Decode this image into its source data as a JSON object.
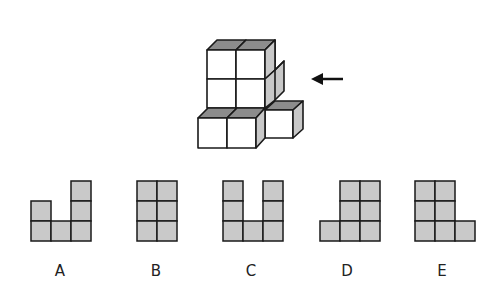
{
  "colors": {
    "line": "#1a1a1a",
    "cube_front": "#ffffff",
    "cube_top": "#8c8c8c",
    "cube_side": "#c8c8c8",
    "cell_fill": "#c9c9c9",
    "background": "#ffffff"
  },
  "figure": {
    "arrow_icon": "arrow-left"
  },
  "options": [
    {
      "label": "A",
      "cells": [
        [
          0,
          1
        ],
        [
          0,
          2
        ],
        [
          1,
          2
        ],
        [
          2,
          0
        ],
        [
          2,
          1
        ],
        [
          2,
          2
        ]
      ]
    },
    {
      "label": "B",
      "cells": [
        [
          0,
          0
        ],
        [
          1,
          0
        ],
        [
          0,
          1
        ],
        [
          1,
          1
        ],
        [
          0,
          2
        ],
        [
          1,
          2
        ]
      ]
    },
    {
      "label": "C",
      "cells": [
        [
          0,
          0
        ],
        [
          0,
          1
        ],
        [
          0,
          2
        ],
        [
          1,
          2
        ],
        [
          2,
          0
        ],
        [
          2,
          1
        ],
        [
          2,
          2
        ]
      ]
    },
    {
      "label": "D",
      "cells": [
        [
          1,
          0
        ],
        [
          2,
          0
        ],
        [
          1,
          1
        ],
        [
          2,
          1
        ],
        [
          0,
          2
        ],
        [
          1,
          2
        ],
        [
          2,
          2
        ]
      ]
    },
    {
      "label": "E",
      "cells": [
        [
          0,
          0
        ],
        [
          1,
          0
        ],
        [
          0,
          1
        ],
        [
          1,
          1
        ],
        [
          0,
          2
        ],
        [
          1,
          2
        ],
        [
          2,
          2
        ]
      ]
    }
  ]
}
